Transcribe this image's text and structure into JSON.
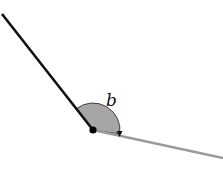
{
  "diagram": {
    "type": "angle",
    "angle_label": "b",
    "vertex": {
      "x": 93,
      "y": 130
    },
    "ray_dark": {
      "x1": 2,
      "y1": 14,
      "color": "#111111"
    },
    "ray_light": {
      "x2": 223,
      "y2": 158,
      "color": "#9a9a9a"
    },
    "arc_fill": "#a6a6a6",
    "arc_radius": 27
  }
}
